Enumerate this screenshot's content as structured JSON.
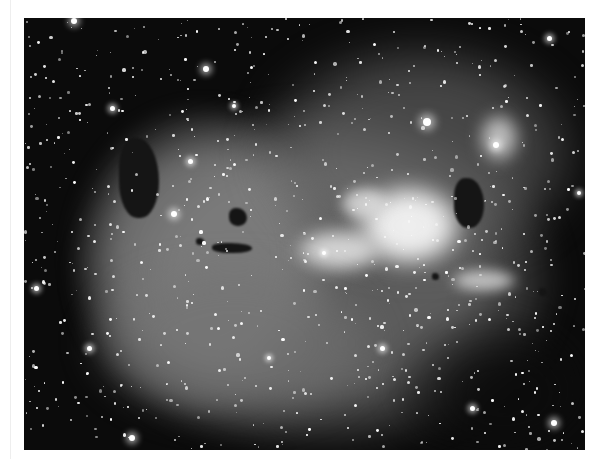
{
  "image": {
    "subject": "emission nebula star field",
    "palette": {
      "background": "#0b0b0b",
      "nebula_mid": "#7a7a7a",
      "nebula_bright": "#f2f2f2",
      "dark_lane": "#1a1a1a",
      "frame": "#ffffff"
    },
    "frame": {
      "left": 24,
      "top": 18,
      "width": 561,
      "height": 432
    }
  },
  "nebula_regions": [
    {
      "name": "main-shell",
      "x": 60,
      "y": 90,
      "w": 470,
      "h": 340,
      "color": "rgba(120,120,120,0.75)",
      "blur": 14
    },
    {
      "name": "left-bubble",
      "x": 50,
      "y": 90,
      "w": 260,
      "h": 300,
      "color": "rgba(135,135,135,0.7)",
      "blur": 10
    },
    {
      "name": "upper-right-glow",
      "x": 230,
      "y": 20,
      "w": 330,
      "h": 230,
      "color": "rgba(110,110,110,0.6)",
      "blur": 18
    },
    {
      "name": "central-bright-core",
      "x": 330,
      "y": 165,
      "w": 110,
      "h": 85,
      "color": "rgba(245,245,245,0.95)",
      "blur": 10
    },
    {
      "name": "arc-bright-left",
      "x": 270,
      "y": 210,
      "w": 90,
      "h": 45,
      "color": "rgba(230,230,230,0.85)",
      "blur": 8
    },
    {
      "name": "bright-knot-top",
      "x": 315,
      "y": 168,
      "w": 50,
      "h": 35,
      "color": "rgba(225,225,225,0.8)",
      "blur": 6
    },
    {
      "name": "right-knot",
      "x": 455,
      "y": 95,
      "w": 40,
      "h": 50,
      "color": "rgba(220,220,220,0.8)",
      "blur": 8
    },
    {
      "name": "lower-right-streak",
      "x": 425,
      "y": 250,
      "w": 70,
      "h": 25,
      "color": "rgba(215,215,215,0.8)",
      "blur": 6
    },
    {
      "name": "lower-left-lobe",
      "x": 60,
      "y": 240,
      "w": 300,
      "h": 170,
      "color": "rgba(115,115,115,0.65)",
      "blur": 14
    }
  ],
  "dark_lanes": [
    {
      "name": "globule-1",
      "x": 205,
      "y": 190,
      "w": 18,
      "h": 18
    },
    {
      "name": "globule-2",
      "x": 188,
      "y": 225,
      "w": 40,
      "h": 10
    },
    {
      "name": "globule-3",
      "x": 172,
      "y": 220,
      "w": 8,
      "h": 7
    },
    {
      "name": "right-dark-lane",
      "x": 430,
      "y": 160,
      "w": 30,
      "h": 50
    },
    {
      "name": "lower-right-dark",
      "x": 360,
      "y": 290,
      "w": 200,
      "h": 142
    },
    {
      "name": "left-shell-shadow",
      "x": 95,
      "y": 120,
      "w": 40,
      "h": 80
    },
    {
      "name": "small-globule",
      "x": 408,
      "y": 255,
      "w": 7,
      "h": 7
    },
    {
      "name": "tiny-globule-right",
      "x": 515,
      "y": 270,
      "w": 8,
      "h": 8
    }
  ],
  "bright_stars": [
    {
      "x": 50,
      "y": 3,
      "r": 3
    },
    {
      "x": 182,
      "y": 51,
      "r": 3
    },
    {
      "x": 403,
      "y": 104,
      "r": 4
    },
    {
      "x": 150,
      "y": 196,
      "r": 3
    },
    {
      "x": 88,
      "y": 90,
      "r": 2.5
    },
    {
      "x": 166,
      "y": 143,
      "r": 2.5
    },
    {
      "x": 472,
      "y": 127,
      "r": 3
    },
    {
      "x": 108,
      "y": 420,
      "r": 3
    },
    {
      "x": 358,
      "y": 330,
      "r": 2.5
    },
    {
      "x": 530,
      "y": 405,
      "r": 3
    },
    {
      "x": 448,
      "y": 390,
      "r": 2.5
    },
    {
      "x": 12,
      "y": 270,
      "r": 2.5
    },
    {
      "x": 65,
      "y": 330,
      "r": 2.5
    },
    {
      "x": 245,
      "y": 340,
      "r": 2
    },
    {
      "x": 525,
      "y": 20,
      "r": 2.5
    },
    {
      "x": 555,
      "y": 175,
      "r": 2
    },
    {
      "x": 210,
      "y": 88,
      "r": 2
    },
    {
      "x": 300,
      "y": 235,
      "r": 2
    }
  ],
  "starfield": {
    "count": 900,
    "seed": 7,
    "max_radius": 1.3
  }
}
